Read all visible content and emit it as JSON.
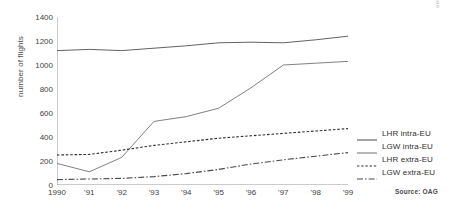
{
  "chart_data": {
    "type": "line",
    "title": "",
    "xlabel": "",
    "ylabel": "number of flights",
    "x": [
      1990,
      1991,
      1992,
      1993,
      1994,
      1995,
      1996,
      1997,
      1998,
      1999
    ],
    "xtick_labels": [
      "1990",
      "'91",
      "'92",
      "'93",
      "'94",
      "'95",
      "'96",
      "'97",
      "'98",
      "'99"
    ],
    "ytick_labels": [
      "0",
      "200",
      "400",
      "600",
      "800",
      "1000",
      "1200",
      "1400"
    ],
    "yticks": [
      0,
      200,
      400,
      600,
      800,
      1000,
      1200,
      1400
    ],
    "ylim": [
      0,
      1400
    ],
    "xlim": [
      1990,
      1999
    ],
    "grid": false,
    "legend_position": "right",
    "series": [
      {
        "name": "LHR intra-EU",
        "style": "solid",
        "color": "#5a5a5a",
        "values": [
          1120,
          1130,
          1120,
          1140,
          1160,
          1185,
          1190,
          1185,
          1210,
          1240
        ]
      },
      {
        "name": "LGW intra-EU",
        "style": "solid",
        "color": "#7a7a7a",
        "values": [
          180,
          110,
          230,
          530,
          570,
          640,
          810,
          1000,
          1015,
          1030
        ]
      },
      {
        "name": "LHR extra-EU",
        "style": "dashed",
        "color": "#2e2e2e",
        "values": [
          250,
          255,
          290,
          330,
          360,
          390,
          410,
          430,
          450,
          470
        ]
      },
      {
        "name": "LGW extra-EU",
        "style": "dashdot",
        "color": "#4a4a4a",
        "values": [
          45,
          50,
          55,
          70,
          95,
          130,
          175,
          210,
          240,
          270
        ]
      }
    ]
  },
  "footer": {
    "source": "Source: OAG"
  },
  "watermark": {
    "text": "aera"
  }
}
